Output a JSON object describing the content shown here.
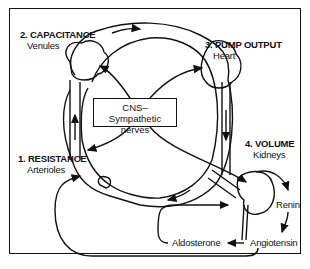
{
  "diagram": {
    "title": "",
    "nodes": {
      "capacitance": {
        "number_title": "2. CAPACITANCE",
        "subtitle": "Venules"
      },
      "pump_output": {
        "number_title": "3. PUMP OUTPUT",
        "subtitle": "Heart"
      },
      "resistance": {
        "number_title": "1. RESISTANCE",
        "subtitle": "Arterioles"
      },
      "volume": {
        "number_title": "4. VOLUME",
        "subtitle": "Kidneys"
      },
      "cns": {
        "line1": "CNS–",
        "line2": "Sympathetic nerves"
      },
      "renin": {
        "label": "Renin"
      },
      "angiotensin": {
        "label": "Angiotensin"
      },
      "aldosterone": {
        "label": "Aldosterone"
      }
    },
    "edges": [
      {
        "from": "CNS–Sympathetic nerves",
        "to": "Venules"
      },
      {
        "from": "CNS–Sympathetic nerves",
        "to": "Heart"
      },
      {
        "from": "CNS–Sympathetic nerves",
        "to": "Arterioles"
      },
      {
        "from": "CNS–Sympathetic nerves",
        "to": "Kidneys"
      },
      {
        "from": "Kidneys",
        "to": "Renin"
      },
      {
        "from": "Renin",
        "to": "Angiotensin"
      },
      {
        "from": "Angiotensin",
        "to": "Aldosterone"
      },
      {
        "from": "Aldosterone",
        "to": "Kidneys"
      },
      {
        "from": "Angiotensin",
        "to": "Arterioles"
      }
    ],
    "colors": {
      "ink": "#111111",
      "background": "#ffffff"
    }
  }
}
